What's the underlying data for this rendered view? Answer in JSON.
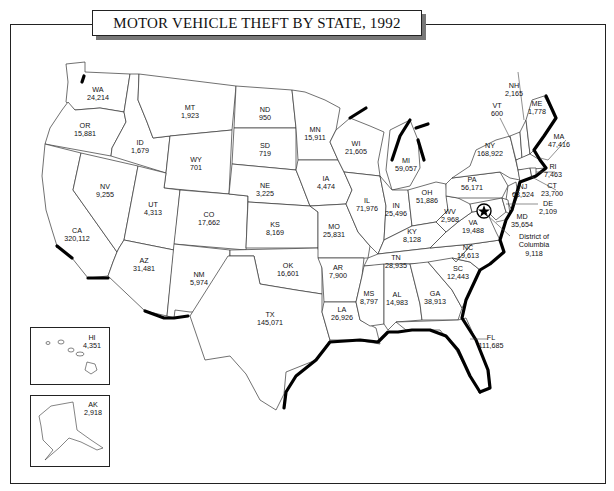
{
  "title": "MOTOR VEHICLE THEFT BY STATE, 1992",
  "map_data": {
    "year": 1992,
    "measure": "Motor vehicle thefts",
    "states": [
      {
        "abbr": "WA",
        "value": "24,214"
      },
      {
        "abbr": "OR",
        "value": "15,881"
      },
      {
        "abbr": "CA",
        "value": "320,112"
      },
      {
        "abbr": "NV",
        "value": "9,255"
      },
      {
        "abbr": "ID",
        "value": "1,679"
      },
      {
        "abbr": "MT",
        "value": "1,923"
      },
      {
        "abbr": "WY",
        "value": "701"
      },
      {
        "abbr": "UT",
        "value": "4,313"
      },
      {
        "abbr": "AZ",
        "value": "31,481"
      },
      {
        "abbr": "CO",
        "value": "17,662"
      },
      {
        "abbr": "NM",
        "value": "5,974"
      },
      {
        "abbr": "ND",
        "value": "950"
      },
      {
        "abbr": "SD",
        "value": "719"
      },
      {
        "abbr": "NE",
        "value": "3,225"
      },
      {
        "abbr": "KS",
        "value": "8,169"
      },
      {
        "abbr": "OK",
        "value": "16,601"
      },
      {
        "abbr": "TX",
        "value": "145,071"
      },
      {
        "abbr": "MN",
        "value": "15,911"
      },
      {
        "abbr": "IA",
        "value": "4,474"
      },
      {
        "abbr": "MO",
        "value": "25,831"
      },
      {
        "abbr": "AR",
        "value": "7,900"
      },
      {
        "abbr": "LA",
        "value": "26,926"
      },
      {
        "abbr": "WI",
        "value": "21,605"
      },
      {
        "abbr": "IL",
        "value": "71,976"
      },
      {
        "abbr": "MI",
        "value": "59,057"
      },
      {
        "abbr": "IN",
        "value": "25,496"
      },
      {
        "abbr": "OH",
        "value": "51,886"
      },
      {
        "abbr": "KY",
        "value": "8,128"
      },
      {
        "abbr": "TN",
        "value": "28,935"
      },
      {
        "abbr": "MS",
        "value": "8,797"
      },
      {
        "abbr": "AL",
        "value": "14,983"
      },
      {
        "abbr": "GA",
        "value": "38,913"
      },
      {
        "abbr": "FL",
        "value": "111,685"
      },
      {
        "abbr": "SC",
        "value": "12,443"
      },
      {
        "abbr": "NC",
        "value": "19,613"
      },
      {
        "abbr": "VA",
        "value": "19,488"
      },
      {
        "abbr": "WV",
        "value": "2,968"
      },
      {
        "abbr": "PA",
        "value": "56,171"
      },
      {
        "abbr": "NY",
        "value": "168,922"
      },
      {
        "abbr": "VT",
        "value": "600"
      },
      {
        "abbr": "NH",
        "value": "2,165"
      },
      {
        "abbr": "ME",
        "value": "1,778"
      },
      {
        "abbr": "MA",
        "value": "47,416"
      },
      {
        "abbr": "RI",
        "value": "7,463"
      },
      {
        "abbr": "CT",
        "value": "23,700"
      },
      {
        "abbr": "NJ",
        "value": "63,524"
      },
      {
        "abbr": "DE",
        "value": "2,109"
      },
      {
        "abbr": "MD",
        "value": "35,654"
      },
      {
        "abbr": "DC",
        "name": "District of Columbia",
        "value": "9,118"
      },
      {
        "abbr": "HI",
        "value": "4,351"
      },
      {
        "abbr": "AK",
        "value": "2,918"
      }
    ]
  }
}
